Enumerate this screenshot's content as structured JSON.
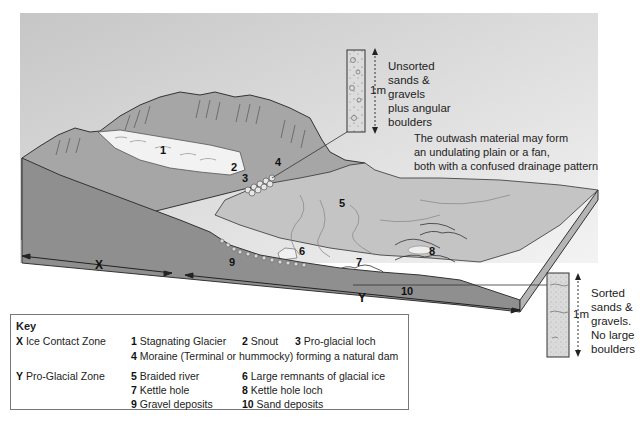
{
  "diagram": {
    "type": "block diagram of glacial landscape",
    "zones": [
      {
        "letter": "X",
        "name": "Ice Contact Zone"
      },
      {
        "letter": "Y",
        "name": "Pro-Glacial Zone"
      }
    ],
    "feature_labels": [
      "1",
      "2",
      "3",
      "4",
      "5",
      "6",
      "7",
      "8",
      "9",
      "10"
    ]
  },
  "upper_column": {
    "scale": "1m",
    "lines": [
      "Unsorted",
      "sands &",
      "gravels",
      "plus angular",
      "boulders"
    ]
  },
  "lower_column": {
    "scale": "1m",
    "lines": [
      "Sorted",
      "sands &",
      "gravels.",
      "No large",
      "boulders"
    ]
  },
  "note": {
    "lines": [
      "The outwash material may form",
      "an undulating plain or a fan,",
      "both with a confused drainage pattern"
    ]
  },
  "key": {
    "title": "Key",
    "zone_x": {
      "letter": "X",
      "name": "Ice Contact Zone"
    },
    "zone_y": {
      "letter": "Y",
      "name": "Pro-Glacial Zone"
    },
    "items": [
      {
        "num": "1",
        "text": "Stagnating Glacier"
      },
      {
        "num": "2",
        "text": "Snout"
      },
      {
        "num": "3",
        "text": "Pro-glacial loch"
      },
      {
        "num": "4",
        "text": "Moraine (Terminal or hummocky) forming a natural dam"
      },
      {
        "num": "5",
        "text": "Braided river"
      },
      {
        "num": "6",
        "text": "Large remnants of glacial ice"
      },
      {
        "num": "7",
        "text": "Kettle hole"
      },
      {
        "num": "8",
        "text": "Kettle hole loch"
      },
      {
        "num": "9",
        "text": "Gravel deposits"
      },
      {
        "num": "10",
        "text": "Sand deposits"
      }
    ]
  },
  "colors": {
    "sky_top": "#c9c9c9",
    "sky_bottom": "#f0f0f0",
    "mountain": "#a4a4a4",
    "plain": "#c4c4c4",
    "block_front": "#8f8f8f",
    "block_side": "#b5b5b5",
    "glacier": "#f2f2f2"
  }
}
